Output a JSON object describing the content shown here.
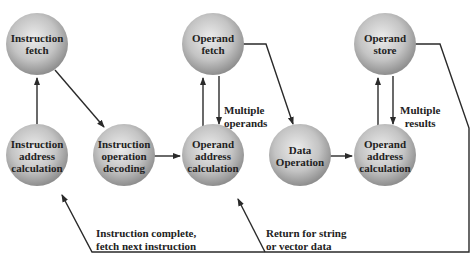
{
  "diagram": {
    "type": "instruction-cycle-state-diagram",
    "colors": {
      "node_light": "#e6e6e6",
      "node_dark": "#8c8c8c",
      "line": "#2a2a2a",
      "text": "#222222"
    },
    "nodes": [
      {
        "id": "if",
        "label": "Instruction fetch",
        "lines": [
          "Instruction",
          "fetch"
        ],
        "cx": 37,
        "cy": 44
      },
      {
        "id": "of",
        "label": "Operand fetch",
        "lines": [
          "Operand",
          "fetch"
        ],
        "cx": 213,
        "cy": 44
      },
      {
        "id": "os",
        "label": "Operand store",
        "lines": [
          "Operand",
          "store"
        ],
        "cx": 385,
        "cy": 44
      },
      {
        "id": "iac",
        "label": "Instruction address calculation",
        "lines": [
          "Instruction",
          "address",
          "calculation"
        ],
        "cx": 37,
        "cy": 155
      },
      {
        "id": "iod",
        "label": "Instruction operation decoding",
        "lines": [
          "Instruction",
          "operation",
          "decoding"
        ],
        "cx": 124,
        "cy": 155
      },
      {
        "id": "oac1",
        "label": "Operand address calculation",
        "lines": [
          "Operand",
          "address",
          "calculation"
        ],
        "cx": 213,
        "cy": 155
      },
      {
        "id": "do",
        "label": "Data Operation",
        "lines": [
          "Data",
          "Operation"
        ],
        "cx": 300,
        "cy": 155
      },
      {
        "id": "oac2",
        "label": "Operand address calculation",
        "lines": [
          "Operand",
          "address",
          "calculation"
        ],
        "cx": 385,
        "cy": 155
      }
    ],
    "edge_labels": {
      "multiple_operands": [
        "Multiple",
        "operands"
      ],
      "multiple_results": [
        "Multiple",
        "results"
      ],
      "instruction_complete": [
        "Instruction complete,",
        "fetch next instruction"
      ],
      "return_string": [
        "Return for string",
        "or vector data"
      ]
    }
  }
}
